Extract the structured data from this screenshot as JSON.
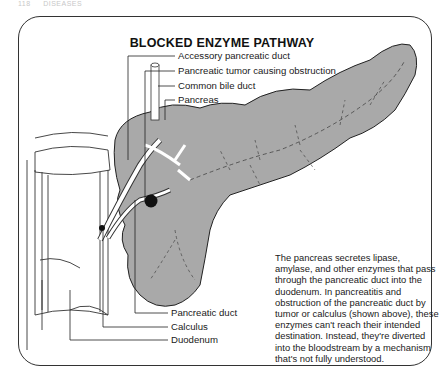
{
  "running_head": {
    "page_number": "118",
    "section": "DISEASES"
  },
  "figure": {
    "title": "BLOCKED ENZYME PATHWAY",
    "labels_top": [
      "Accessory pancreatic duct",
      "Pancreatic tumor causing obstruction",
      "Common bile duct",
      "Pancreas"
    ],
    "labels_bottom": [
      "Pancreatic duct",
      "Calculus",
      "Duodenum"
    ],
    "description": "The pancreas secretes lipase, amylase, and other enzymes that pass through the pancreatic duct into the duodenum. In pancreatitis and obstruction of the pancreatic duct by tumor or calculus (shown above), these enzymes can't reach their intended destination. Instead, they're diverted into the bloodstream by a mechanism that's not fully understood.",
    "colors": {
      "pancreas_fill": "#a9a9a9",
      "outline": "#222222",
      "background": "#ffffff"
    }
  }
}
